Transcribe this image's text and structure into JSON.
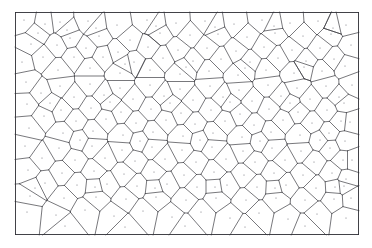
{
  "figure": {
    "kind": "voronoi-tessellation",
    "title": "",
    "caption": "",
    "width": 372,
    "height": 248,
    "frame": {
      "x": 15,
      "y": 12,
      "width": 344,
      "height": 223
    },
    "style": {
      "background_color": "#ffffff",
      "edge_color": "#3d3d44",
      "frame_color": "#2e2e35",
      "seed_color": "#6b6b74",
      "edge_width": 0.7,
      "frame_width": 0.9,
      "seed_radius": 0.55
    }
  },
  "chart_data": {
    "type": "scatter",
    "title": "",
    "xlabel": "",
    "ylabel": "",
    "xlim": [
      15,
      359
    ],
    "ylim": [
      12,
      235
    ],
    "grid": false,
    "legend": "none",
    "series": [
      {
        "name": "voronoi-seeds",
        "point_count": 156,
        "points": [
          [
            24,
            20
          ],
          [
            45,
            24
          ],
          [
            31,
            44
          ],
          [
            22,
            62
          ],
          [
            43,
            57
          ],
          [
            60,
            22
          ],
          [
            70,
            38
          ],
          [
            57,
            45
          ],
          [
            74,
            57
          ],
          [
            58,
            70
          ],
          [
            88,
            21
          ],
          [
            99,
            36
          ],
          [
            86,
            48
          ],
          [
            103,
            57
          ],
          [
            90,
            68
          ],
          [
            117,
            25
          ],
          [
            130,
            40
          ],
          [
            118,
            52
          ],
          [
            134,
            62
          ],
          [
            120,
            73
          ],
          [
            147,
            20
          ],
          [
            160,
            33
          ],
          [
            148,
            47
          ],
          [
            163,
            58
          ],
          [
            150,
            70
          ],
          [
            176,
            23
          ],
          [
            190,
            35
          ],
          [
            178,
            50
          ],
          [
            193,
            61
          ],
          [
            180,
            74
          ],
          [
            205,
            21
          ],
          [
            218,
            34
          ],
          [
            207,
            48
          ],
          [
            221,
            59
          ],
          [
            209,
            71
          ],
          [
            234,
            24
          ],
          [
            247,
            37
          ],
          [
            236,
            51
          ],
          [
            250,
            62
          ],
          [
            238,
            75
          ],
          [
            262,
            20
          ],
          [
            275,
            33
          ],
          [
            264,
            47
          ],
          [
            278,
            58
          ],
          [
            266,
            70
          ],
          [
            290,
            23
          ],
          [
            303,
            36
          ],
          [
            292,
            50
          ],
          [
            306,
            61
          ],
          [
            294,
            73
          ],
          [
            318,
            21
          ],
          [
            331,
            34
          ],
          [
            320,
            48
          ],
          [
            334,
            59
          ],
          [
            322,
            71
          ],
          [
            346,
            25
          ],
          [
            351,
            45
          ],
          [
            345,
            66
          ],
          [
            352,
            85
          ],
          [
            344,
            103
          ],
          [
            26,
            82
          ],
          [
            41,
            93
          ],
          [
            27,
            104
          ],
          [
            44,
            116
          ],
          [
            29,
            128
          ],
          [
            60,
            86
          ],
          [
            74,
            97
          ],
          [
            61,
            110
          ],
          [
            76,
            121
          ],
          [
            63,
            133
          ],
          [
            90,
            84
          ],
          [
            104,
            95
          ],
          [
            91,
            108
          ],
          [
            106,
            119
          ],
          [
            93,
            131
          ],
          [
            120,
            88
          ],
          [
            133,
            99
          ],
          [
            121,
            112
          ],
          [
            136,
            123
          ],
          [
            123,
            135
          ],
          [
            150,
            85
          ],
          [
            164,
            96
          ],
          [
            151,
            109
          ],
          [
            166,
            120
          ],
          [
            153,
            132
          ],
          [
            180,
            89
          ],
          [
            193,
            100
          ],
          [
            181,
            113
          ],
          [
            195,
            124
          ],
          [
            183,
            136
          ],
          [
            210,
            86
          ],
          [
            223,
            97
          ],
          [
            211,
            110
          ],
          [
            225,
            121
          ],
          [
            213,
            133
          ],
          [
            239,
            90
          ],
          [
            252,
            101
          ],
          [
            240,
            114
          ],
          [
            254,
            125
          ],
          [
            242,
            137
          ],
          [
            268,
            85
          ],
          [
            281,
            96
          ],
          [
            269,
            109
          ],
          [
            283,
            120
          ],
          [
            271,
            132
          ],
          [
            297,
            88
          ],
          [
            310,
            99
          ],
          [
            298,
            112
          ],
          [
            312,
            123
          ],
          [
            300,
            135
          ],
          [
            326,
            86
          ],
          [
            339,
            97
          ],
          [
            327,
            110
          ],
          [
            341,
            121
          ],
          [
            329,
            133
          ],
          [
            350,
            122
          ],
          [
            345,
            141
          ],
          [
            352,
            160
          ],
          [
            346,
            179
          ],
          [
            351,
            198
          ],
          [
            25,
            146
          ],
          [
            42,
            158
          ],
          [
            28,
            170
          ],
          [
            45,
            183
          ],
          [
            30,
            196
          ],
          [
            59,
            148
          ],
          [
            75,
            160
          ],
          [
            62,
            173
          ],
          [
            77,
            185
          ],
          [
            64,
            198
          ],
          [
            92,
            146
          ],
          [
            105,
            158
          ],
          [
            94,
            171
          ],
          [
            107,
            184
          ],
          [
            96,
            197
          ],
          [
            122,
            150
          ],
          [
            135,
            161
          ],
          [
            124,
            174
          ],
          [
            137,
            186
          ],
          [
            126,
            199
          ],
          [
            152,
            147
          ],
          [
            165,
            159
          ],
          [
            154,
            172
          ],
          [
            167,
            184
          ],
          [
            156,
            197
          ],
          [
            182,
            150
          ],
          [
            196,
            162
          ],
          [
            184,
            175
          ],
          [
            197,
            187
          ],
          [
            186,
            200
          ],
          [
            212,
            147
          ],
          [
            226,
            159
          ],
          [
            214,
            172
          ],
          [
            227,
            185
          ],
          [
            216,
            198
          ],
          [
            243,
            151
          ],
          [
            255,
            162
          ],
          [
            244,
            175
          ],
          [
            257,
            187
          ],
          [
            246,
            200
          ],
          [
            272,
            148
          ],
          [
            285,
            160
          ],
          [
            274,
            173
          ],
          [
            286,
            185
          ],
          [
            276,
            198
          ],
          [
            301,
            151
          ],
          [
            314,
            162
          ],
          [
            303,
            175
          ],
          [
            316,
            188
          ],
          [
            305,
            200
          ],
          [
            330,
            148
          ],
          [
            343,
            160
          ],
          [
            332,
            173
          ],
          [
            344,
            186
          ],
          [
            334,
            199
          ],
          [
            27,
            212
          ],
          [
            56,
            215
          ],
          [
            85,
            210
          ],
          [
            114,
            216
          ],
          [
            143,
            211
          ],
          [
            172,
            217
          ],
          [
            201,
            212
          ],
          [
            230,
            218
          ],
          [
            259,
            213
          ],
          [
            288,
            219
          ],
          [
            317,
            214
          ],
          [
            346,
            218
          ],
          [
            38,
            33
          ],
          [
            67,
            30
          ],
          [
            96,
            28
          ],
          [
            125,
            64
          ],
          [
            156,
            26
          ],
          [
            186,
            67
          ],
          [
            215,
            27
          ],
          [
            245,
            68
          ],
          [
            274,
            26
          ],
          [
            304,
            67
          ],
          [
            333,
            28
          ],
          [
            50,
            103
          ],
          [
            80,
            140
          ],
          [
            110,
            102
          ],
          [
            140,
            141
          ],
          [
            170,
            103
          ],
          [
            200,
            140
          ],
          [
            230,
            102
          ],
          [
            260,
            141
          ],
          [
            290,
            103
          ],
          [
            320,
            140
          ],
          [
            35,
            188
          ],
          [
            65,
            226
          ],
          [
            95,
            187
          ],
          [
            125,
            227
          ],
          [
            155,
            188
          ],
          [
            185,
            226
          ],
          [
            215,
            187
          ],
          [
            245,
            227
          ],
          [
            275,
            188
          ],
          [
            305,
            226
          ],
          [
            335,
            187
          ]
        ]
      }
    ]
  }
}
